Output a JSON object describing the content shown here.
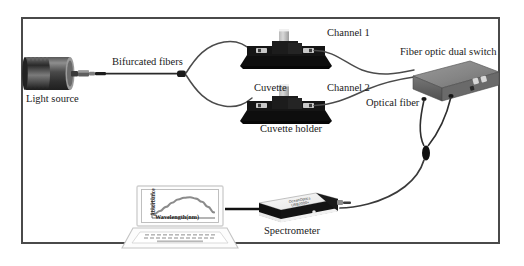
{
  "figure": {
    "border_color": "#4a4a4a",
    "background_color": "#ffffff",
    "line_color": "#3c3c3c",
    "width": 524,
    "height": 266
  },
  "labels": {
    "light_source": "Light source",
    "bifurcated_fibers": "Bifurcated fibers",
    "channel_1": "Channel 1",
    "channel_2": "Channel 2",
    "cuvette": "Cuvette",
    "cuvette_holder": "Cuvette holder",
    "fiber_optic_dual_switch": "Fiber optic dual switch",
    "optical_fiber": "Optical fiber",
    "spectrometer": "Spectrometer"
  },
  "components": [
    {
      "id": "light-source",
      "name": "Light source",
      "type": "lamp-housing",
      "description": "Ridged cylindrical lamp housing with fiber coupler"
    },
    {
      "id": "bifurcated-fiber",
      "name": "Bifurcated fibers",
      "type": "fiber-bundle",
      "description": "Single fiber from light source splitting into two branches"
    },
    {
      "id": "cuvette-holder-1",
      "name": "Channel 1 cuvette holder",
      "type": "cuvette-holder",
      "channel": "Channel 1"
    },
    {
      "id": "cuvette-holder-2",
      "name": "Channel 2 cuvette holder",
      "type": "cuvette-holder",
      "channel": "Channel 2"
    },
    {
      "id": "dual-switch",
      "name": "Fiber optic dual switch",
      "type": "switch-box"
    },
    {
      "id": "spectrometer",
      "name": "Spectrometer",
      "type": "spectrometer-box"
    },
    {
      "id": "laptop",
      "name": "Laptop computer",
      "type": "laptop"
    }
  ],
  "spectrometer_device": {
    "brand": "OceanOptics",
    "model": "USB2000+"
  },
  "chart_data": {
    "type": "line",
    "title": "",
    "xlabel": "Wavelength(nm)",
    "ylabel": "Absorbance",
    "x": [
      0,
      10,
      20,
      30,
      40,
      50,
      60,
      70,
      80,
      90,
      100
    ],
    "values": [
      12,
      26,
      44,
      62,
      76,
      84,
      86,
      80,
      66,
      44,
      20
    ],
    "xlim": [
      0,
      100
    ],
    "ylim": [
      0,
      100
    ],
    "grid": false,
    "legend": "none",
    "ytick_labels": [
      "1.0",
      "0.8",
      "0.6",
      "0.4",
      "0.2",
      "0.0"
    ]
  }
}
